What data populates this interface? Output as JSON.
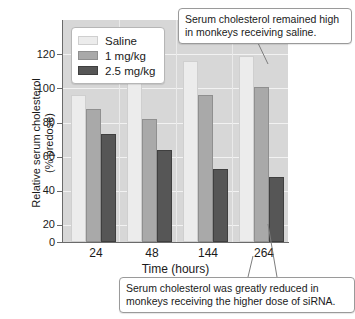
{
  "chart_data": {
    "type": "bar",
    "title": "",
    "xlabel": "Time (hours)",
    "ylabel": "Relative serum cholesterol\n(% predose)",
    "ylabel_line1": "Relative serum cholesterol",
    "ylabel_line2": "(% predose)",
    "categories": [
      "24",
      "48",
      "144",
      "264"
    ],
    "series": [
      {
        "name": "Saline",
        "color": "#ececec",
        "values": [
          86,
          93,
          106,
          109
        ]
      },
      {
        "name": "1 mg/kg",
        "color": "#a9a9a9",
        "values": [
          78,
          72,
          86,
          91
        ]
      },
      {
        "name": "2.5 mg/kg",
        "color": "#565656",
        "values": [
          63,
          54,
          43,
          38
        ]
      }
    ],
    "ylim": [
      0,
      130
    ],
    "yticks": [
      0,
      20,
      40,
      60,
      80,
      100,
      120
    ],
    "ytick_labels": [
      "0",
      "20",
      "40",
      "60",
      "80",
      "100",
      "120"
    ],
    "grid": "horizontal-and-vertical",
    "legend_position": "top-left-inside",
    "plot_background": "#d7d7d7",
    "gridline_color": "#f2f2f2"
  },
  "legend": {
    "items": [
      {
        "label": "Saline"
      },
      {
        "label": "1 mg/kg"
      },
      {
        "label": "2.5 mg/kg"
      }
    ]
  },
  "annotations": [
    {
      "id": "callout-saline",
      "line1": "Serum cholesterol remained high",
      "line2": "in monkeys receiving saline."
    },
    {
      "id": "callout-sirna",
      "line1": "Serum cholesterol was greatly reduced in",
      "line2": "monkeys receiving the higher dose of siRNA."
    }
  ]
}
